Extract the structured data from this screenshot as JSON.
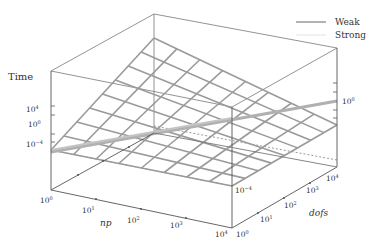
{
  "chart_data": {
    "type": "surface3d",
    "title": "",
    "axes": {
      "x": {
        "label": "np",
        "scale": "log",
        "ticks": [
          "10^0",
          "10^1",
          "10^2",
          "10^3",
          "10^4"
        ],
        "range": [
          1,
          10000
        ]
      },
      "y": {
        "label": "dofs",
        "scale": "log",
        "ticks": [
          "10^0",
          "10^1",
          "10^2",
          "10^3",
          "10^4"
        ],
        "range": [
          1,
          10000
        ]
      },
      "z": {
        "label": "Time",
        "scale": "log",
        "ticks": [
          "10^-4",
          "10^0",
          "10^4"
        ],
        "range": [
          0.0001,
          100000000
        ]
      }
    },
    "legend": {
      "position": "top-right",
      "entries": [
        {
          "name": "Weak",
          "color": "#888888",
          "style": "thick"
        },
        {
          "name": "Strong",
          "color": "#dddddd",
          "style": "thin"
        }
      ]
    },
    "series": [
      {
        "name": "Strong",
        "kind": "surface-grid",
        "grid": "8x8",
        "description": "planar log-log surface of time vs np and dofs"
      },
      {
        "name": "Weak",
        "kind": "line",
        "description": "line across surface at constant dofs/np ratio, time ~ 10^0"
      }
    ],
    "grid": true
  },
  "labels": {
    "zlabel": "Time",
    "xlabel": "np",
    "ylabel": "dofs",
    "legend_weak": "Weak",
    "legend_strong": "Strong",
    "z_ticks_left": [
      {
        "base": "10",
        "exp": "4"
      },
      {
        "base": "10",
        "exp": "0"
      },
      {
        "base": "10",
        "exp": "−4"
      }
    ],
    "z_ticks_right": [
      {
        "base": "10",
        "exp": "0"
      },
      {
        "base": "10",
        "exp": "−4"
      }
    ],
    "x_ticks": [
      {
        "base": "10",
        "exp": "0"
      },
      {
        "base": "10",
        "exp": "1"
      },
      {
        "base": "10",
        "exp": "2"
      },
      {
        "base": "10",
        "exp": "3"
      },
      {
        "base": "10",
        "exp": "4"
      }
    ],
    "y_ticks": [
      {
        "base": "10",
        "exp": "0"
      },
      {
        "base": "10",
        "exp": "1"
      },
      {
        "base": "10",
        "exp": "2"
      },
      {
        "base": "10",
        "exp": "3"
      },
      {
        "base": "10",
        "exp": "4"
      }
    ]
  },
  "colors": {
    "axis": "#555555",
    "grid": "#9a9a9a",
    "weak": "#a8a8a8",
    "strong": "#e0e0e0"
  }
}
